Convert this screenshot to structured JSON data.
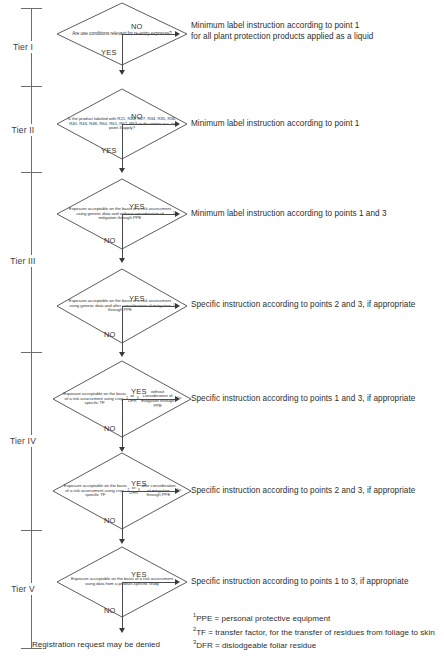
{
  "diagram": {
    "terminal_text": "Registration request may be denied"
  },
  "tiers": [
    {
      "label": "Tier I",
      "top": 8,
      "bottom": 86
    },
    {
      "label": "Tier II",
      "top": 86,
      "bottom": 172
    },
    {
      "label": "Tier III",
      "top": 172,
      "bottom": 352
    },
    {
      "label": "Tier IV",
      "top": 352,
      "bottom": 530
    },
    {
      "label": "Tier V",
      "top": 530,
      "bottom": 648
    }
  ],
  "decisions": [
    {
      "id": "d1",
      "question": "Are use conditions relevant for re-entry exposure?",
      "yes_label": "YES",
      "no_label": "NO",
      "branch_to_outcome": "NO"
    },
    {
      "id": "d2",
      "question": "Is the product labeled with R21, R24, R27, R34, R35, R36, R40, R43, R48, R60, R61, R62, R63 or do criteria acc. to point 3 apply?",
      "yes_label": "YES",
      "no_label": "NO",
      "branch_to_outcome": "NO"
    },
    {
      "id": "d3",
      "question": "Exposure acceptable on the basis of a risk assessment using generic data and without consideration of mitigation through PPE?",
      "yes_label": "YES",
      "no_label": "NO",
      "branch_to_outcome": "YES"
    },
    {
      "id": "d4",
      "question": "Exposure acceptable on the basis of a risk assessment using generic data and after consideration of mitigation through PPE?",
      "yes_label": "YES",
      "no_label": "NO",
      "branch_to_outcome": "YES"
    },
    {
      "id": "d5",
      "question": "Exposure acceptable on the basis of a risk assessment using crop-specific TF or DFR without consideration of mitigation through PPE?",
      "yes_label": "YES",
      "no_label": "NO",
      "branch_to_outcome": "YES"
    },
    {
      "id": "d6",
      "question": "Exposure acceptable on the basis of a risk assessment using crop-specific TF or DFR after consideration of mitigation through PPE?",
      "yes_label": "YES",
      "no_label": "NO",
      "branch_to_outcome": "YES"
    },
    {
      "id": "d7",
      "question": "Exposure acceptable on the basis of a risk assessment using data from a product-specific study",
      "yes_label": "YES",
      "no_label": "NO",
      "branch_to_outcome": "YES"
    }
  ],
  "outcomes": [
    {
      "id": "o1",
      "text": "Minimum label instruction according to point 1\nfor all plant protection products applied as a liquid"
    },
    {
      "id": "o2",
      "text": "Minimum label instruction according to point 1"
    },
    {
      "id": "o3",
      "text": "Minimum label instruction according to points 1 and 3"
    },
    {
      "id": "o4",
      "text": "Specific instruction according to points 2 and 3, if appropriate"
    },
    {
      "id": "o5",
      "text": "Specific instruction according to points 1 and 3, if appropriate"
    },
    {
      "id": "o6",
      "text": "Specific instruction according to points 2 and 3, if appropriate"
    },
    {
      "id": "o7",
      "text": "Specific instruction according to points 1 to 3, if appropriate"
    }
  ],
  "footnotes": [
    {
      "marker": "1",
      "text": "PPE = personal protective equipment"
    },
    {
      "marker": "2",
      "text": "TF = transfer factor, for the transfer of residues from foliage to skin"
    },
    {
      "marker": "3",
      "text": "DFR = dislodgeable foliar residue"
    }
  ],
  "colors": {
    "stroke": "#4a4a4a",
    "rail": "#6d6d6d",
    "text": "#2e2e2e"
  }
}
